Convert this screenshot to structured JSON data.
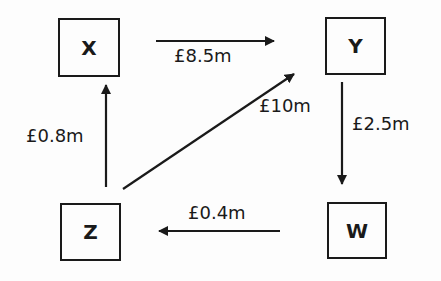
{
  "nodes": {
    "x": "X",
    "y": "Y",
    "z": "Z",
    "w": "W"
  },
  "flows": [
    {
      "from": "X",
      "to": "Y",
      "label": "£8.5m"
    },
    {
      "from": "Y",
      "to": "W",
      "label": "£2.5m"
    },
    {
      "from": "W",
      "to": "Z",
      "label": "£0.4m"
    },
    {
      "from": "Z",
      "to": "X",
      "label": "£0.8m"
    },
    {
      "from": "Z",
      "to": "Y",
      "label": "£10m"
    }
  ],
  "colors": {
    "stroke": "#1a1a1a",
    "background": "#fdfdfd"
  }
}
